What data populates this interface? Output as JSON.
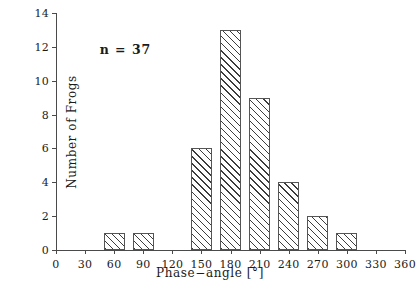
{
  "chart_data": {
    "type": "bar",
    "title": "",
    "subtitle": "",
    "xlabel": "Phase−angle  [°]",
    "ylabel": "Number of Frogs",
    "categories": [
      0,
      30,
      60,
      90,
      120,
      150,
      180,
      210,
      240,
      270,
      300,
      330,
      360
    ],
    "values": [
      0,
      0,
      1,
      1,
      0,
      6,
      13,
      9,
      4,
      2,
      1,
      0,
      0
    ],
    "series": [
      {
        "name": "Number of Frogs",
        "values": [
          0,
          0,
          1,
          1,
          0,
          6,
          13,
          9,
          4,
          2,
          1,
          0,
          0
        ]
      }
    ],
    "xlim": [
      0,
      360
    ],
    "ylim": [
      0,
      14
    ],
    "xticks": [
      0,
      30,
      60,
      90,
      120,
      150,
      180,
      210,
      240,
      270,
      300,
      330,
      360
    ],
    "yticks": [
      0,
      2,
      4,
      6,
      8,
      10,
      12,
      14
    ],
    "xtick_labels": [
      "0",
      "30",
      "60",
      "90",
      "120",
      "150",
      "180",
      "210",
      "240",
      "270",
      "300",
      "330",
      "360"
    ],
    "ytick_labels": [
      "0",
      "2",
      "4",
      "6",
      "8",
      "10",
      "12",
      "14"
    ],
    "bar_width_deg": 22,
    "bars_centered_on_ticks": true,
    "grid": false,
    "legend": false,
    "legend_position": "none",
    "annotations": [
      {
        "text": "n  =  37",
        "x_deg": 45,
        "y_value": 12.3
      }
    ],
    "colors": {
      "axis": "#4a4a4a",
      "text": "#1b1b1b",
      "bar_edge": "#555555",
      "bar_fill": "#ffffff",
      "bar_hatch": "#3c3c3c",
      "background": "#ffffff"
    },
    "hatch": "///"
  }
}
